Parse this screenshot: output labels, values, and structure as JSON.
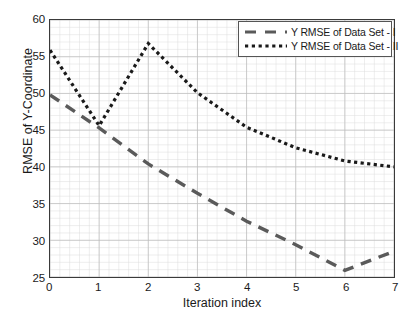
{
  "chart_data": {
    "type": "line",
    "title": "",
    "xlabel": "Iteration index",
    "ylabel": "RMSE of Y-Coordinate",
    "xlim": [
      0,
      7
    ],
    "ylim": [
      25,
      60
    ],
    "xticks": [
      "0",
      "1",
      "2",
      "3",
      "4",
      "5",
      "6",
      "7"
    ],
    "yticks": [
      "25",
      "30",
      "35",
      "40",
      "45",
      "50",
      "55",
      "60"
    ],
    "grid": true,
    "minor_grid": true,
    "legend_position": "top-right",
    "x": [
      0,
      1,
      2,
      3,
      4,
      5,
      6,
      7
    ],
    "series": [
      {
        "name": "Y RMSE of Data Set - I",
        "style": "dashed",
        "color": "#5a5a5a",
        "values": [
          49.8,
          45.3,
          40.4,
          36.4,
          32.6,
          29.4,
          25.9,
          28.5
        ]
      },
      {
        "name": "Y RMSE of Data Set - II",
        "style": "dotted",
        "color": "#1a1a1a",
        "values": [
          55.9,
          45.6,
          56.8,
          50.1,
          45.4,
          42.6,
          40.8,
          40.0
        ]
      }
    ]
  },
  "axes": {
    "x_label": "Iteration index",
    "y_label": "RMSE of Y-Coordinate",
    "x_ticks": [
      "0",
      "1",
      "2",
      "3",
      "4",
      "5",
      "6",
      "7"
    ],
    "y_ticks": [
      "60",
      "55",
      "50",
      "45",
      "40",
      "35",
      "30",
      "25"
    ]
  },
  "legend": {
    "items": [
      {
        "label": "Y RMSE of Data Set - I",
        "style": "dashed"
      },
      {
        "label": "Y RMSE of Data Set - II",
        "style": "dotted"
      }
    ]
  },
  "colors": {
    "series_1": "#5a5a5a",
    "series_2": "#1a1a1a",
    "axis": "#3a3a3a",
    "grid_major": "#bcbcbc",
    "grid_minor": "#dcdcdc",
    "background": "#ffffff"
  }
}
